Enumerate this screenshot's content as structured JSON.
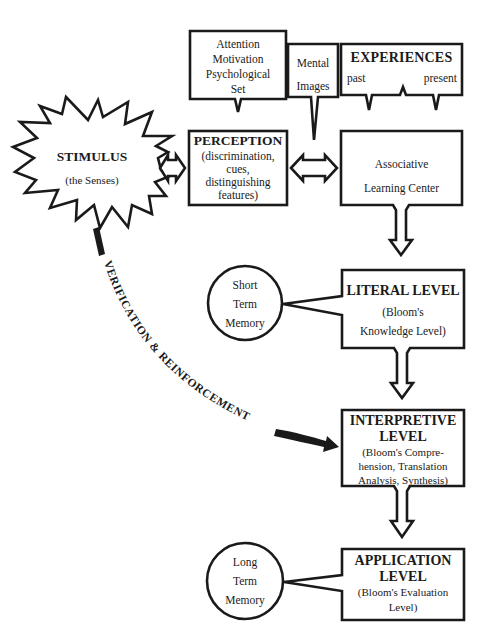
{
  "diagram": {
    "type": "flowchart",
    "nodes": {
      "stimulus": {
        "title": "STIMULUS",
        "subtitle": "(the Senses)"
      },
      "attention": {
        "lines": [
          "Attention",
          "Motivation",
          "Psychological",
          "Set"
        ]
      },
      "mental_images": {
        "lines": [
          "Mental",
          "Images"
        ]
      },
      "experiences": {
        "title": "EXPERIENCES",
        "left": "past",
        "right": "present"
      },
      "perception": {
        "title": "PERCEPTION",
        "lines": [
          "(discrimination,",
          "cues,",
          "distinguishing",
          "features)"
        ]
      },
      "associative": {
        "lines": [
          "Associative",
          "Learning Center"
        ]
      },
      "short_term_memory": {
        "lines": [
          "Short",
          "Term",
          "Memory"
        ]
      },
      "literal": {
        "title": "LITERAL LEVEL",
        "lines": [
          "(Bloom's",
          "Knowledge Level)"
        ]
      },
      "interpretive": {
        "title_lines": [
          "INTERPRETIVE",
          "LEVEL"
        ],
        "lines": [
          "(Bloom's Compre-",
          "hension, Translation",
          "Analysis, Synthesis)"
        ]
      },
      "long_term_memory": {
        "lines": [
          "Long",
          "Term",
          "Memory"
        ]
      },
      "application": {
        "title_lines": [
          "APPLICATION",
          "LEVEL"
        ],
        "lines": [
          "(Bloom's Evaluation",
          "Level)"
        ]
      }
    },
    "feedback_path": {
      "label": "VERIFICATION & REINFORCEMENT"
    },
    "edges": [
      {
        "from": "stimulus",
        "to": "perception",
        "style": "double-arrow"
      },
      {
        "from": "attention",
        "to": "perception",
        "style": "callout"
      },
      {
        "from": "mental_images",
        "to": "perception-associative",
        "style": "callout"
      },
      {
        "from": "experiences",
        "to": "associative",
        "style": "callout"
      },
      {
        "from": "perception",
        "to": "associative",
        "style": "double-arrow"
      },
      {
        "from": "associative",
        "to": "literal",
        "style": "hollow-arrow"
      },
      {
        "from": "short_term_memory",
        "to": "literal",
        "style": "callout"
      },
      {
        "from": "literal",
        "to": "interpretive",
        "style": "hollow-arrow"
      },
      {
        "from": "stimulus",
        "to": "interpretive",
        "style": "thick-curved-arrow"
      },
      {
        "from": "interpretive",
        "to": "application",
        "style": "hollow-arrow"
      },
      {
        "from": "long_term_memory",
        "to": "application",
        "style": "callout"
      }
    ]
  }
}
